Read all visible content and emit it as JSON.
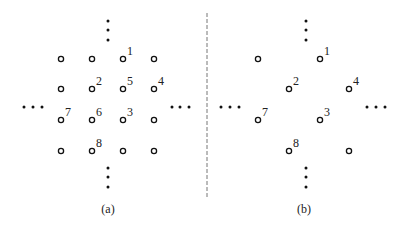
{
  "figure": {
    "divider": {
      "style": "dashed",
      "color": "#777777"
    },
    "panels": [
      {
        "id": "a",
        "caption": "(a)",
        "nodes": [
          {
            "cx": 61,
            "cy": 59,
            "label": ""
          },
          {
            "cx": 92,
            "cy": 59,
            "label": ""
          },
          {
            "cx": 123,
            "cy": 59,
            "label": "1"
          },
          {
            "cx": 154,
            "cy": 59,
            "label": ""
          },
          {
            "cx": 61,
            "cy": 89,
            "label": ""
          },
          {
            "cx": 92,
            "cy": 89,
            "label": "2"
          },
          {
            "cx": 123,
            "cy": 89,
            "label": "5"
          },
          {
            "cx": 154,
            "cy": 89,
            "label": "4"
          },
          {
            "cx": 61,
            "cy": 120,
            "label": "7"
          },
          {
            "cx": 92,
            "cy": 120,
            "label": "6"
          },
          {
            "cx": 123,
            "cy": 120,
            "label": "3"
          },
          {
            "cx": 154,
            "cy": 120,
            "label": ""
          },
          {
            "cx": 61,
            "cy": 151,
            "label": ""
          },
          {
            "cx": 92,
            "cy": 151,
            "label": "8"
          },
          {
            "cx": 123,
            "cy": 151,
            "label": ""
          },
          {
            "cx": 154,
            "cy": 151,
            "label": ""
          }
        ],
        "ellipsis_dots": {
          "top": [
            [
              108,
              21
            ],
            [
              108,
              30
            ],
            [
              108,
              40
            ]
          ],
          "bottom": [
            [
              108,
              168
            ],
            [
              108,
              177
            ],
            [
              108,
              187
            ]
          ],
          "left": [
            [
              24,
              107
            ],
            [
              33,
              107
            ],
            [
              42,
              107
            ]
          ],
          "right": [
            [
              172,
              107
            ],
            [
              180,
              107
            ],
            [
              189,
              107
            ]
          ]
        },
        "caption_pos": [
          108,
          213
        ]
      },
      {
        "id": "b",
        "caption": "(b)",
        "nodes": [
          {
            "cx": 258,
            "cy": 59,
            "label": ""
          },
          {
            "cx": 320,
            "cy": 59,
            "label": "1"
          },
          {
            "cx": 289,
            "cy": 89,
            "label": "2"
          },
          {
            "cx": 349,
            "cy": 89,
            "label": "4"
          },
          {
            "cx": 258,
            "cy": 120,
            "label": "7"
          },
          {
            "cx": 320,
            "cy": 120,
            "label": "3"
          },
          {
            "cx": 289,
            "cy": 151,
            "label": "8"
          },
          {
            "cx": 349,
            "cy": 151,
            "label": ""
          }
        ],
        "ellipsis_dots": {
          "top": [
            [
              306,
              21
            ],
            [
              306,
              30
            ],
            [
              306,
              40
            ]
          ],
          "bottom": [
            [
              306,
              168
            ],
            [
              306,
              177
            ],
            [
              306,
              187
            ]
          ],
          "left": [
            [
              221,
              107
            ],
            [
              230,
              107
            ],
            [
              239,
              107
            ]
          ],
          "right": [
            [
              367,
              107
            ],
            [
              376,
              107
            ],
            [
              385,
              107
            ]
          ]
        },
        "caption_pos": [
          304,
          213
        ]
      }
    ]
  }
}
